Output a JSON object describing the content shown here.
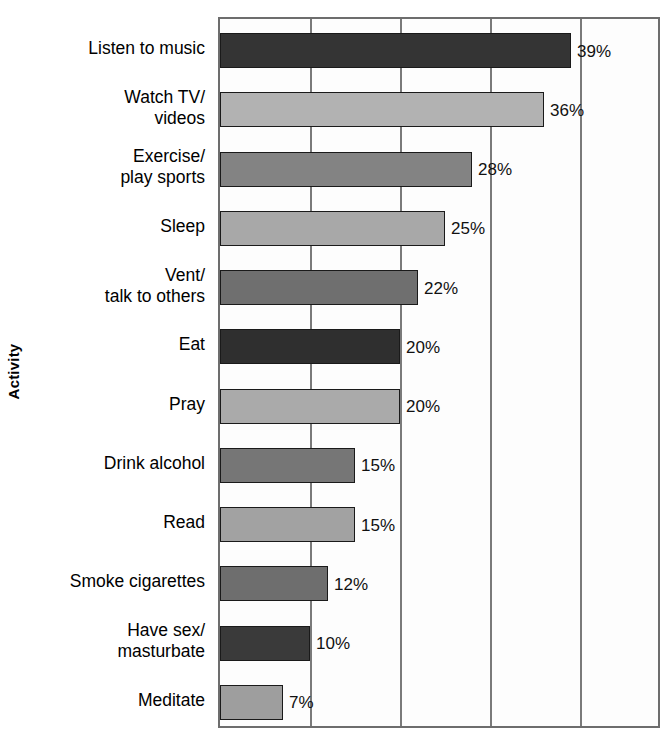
{
  "chart_data": {
    "type": "bar",
    "orientation": "horizontal",
    "title": "",
    "xlabel": "",
    "ylabel": "Activity",
    "xlim": [
      0,
      49
    ],
    "grid": true,
    "gridlines": [
      10,
      20,
      30,
      40
    ],
    "legend": "none",
    "value_suffix": "%",
    "categories": [
      "Listen to music",
      "Watch TV/ videos",
      "Exercise/ play sports",
      "Sleep",
      "Vent/ talk to others",
      "Eat",
      "Pray",
      "Drink alcohol",
      "Read",
      "Smoke cigarettes",
      "Have sex/ masturbate",
      "Meditate"
    ],
    "values": [
      39,
      36,
      28,
      25,
      22,
      20,
      20,
      15,
      15,
      12,
      10,
      7
    ],
    "value_labels": [
      "39%",
      "36%",
      "28%",
      "25%",
      "22%",
      "20%",
      "20%",
      "15%",
      "15%",
      "12%",
      "10%",
      "7%"
    ],
    "bar_colors": [
      "#343434",
      "#b2b2b2",
      "#838383",
      "#a8a8a8",
      "#6f6f6f",
      "#2f2f2f",
      "#aaaaaa",
      "#767676",
      "#a2a2a2",
      "#6e6e6e",
      "#3a3a3a",
      "#9e9e9e"
    ]
  },
  "axis": {
    "y_title": "Activity"
  },
  "bars": [
    {
      "label_line1": "Listen to music",
      "label_line2": "",
      "value": 39,
      "value_label": "39%",
      "color": "#343434"
    },
    {
      "label_line1": "Watch TV/",
      "label_line2": "videos",
      "value": 36,
      "value_label": "36%",
      "color": "#b2b2b2"
    },
    {
      "label_line1": "Exercise/",
      "label_line2": "play sports",
      "value": 28,
      "value_label": "28%",
      "color": "#838383"
    },
    {
      "label_line1": "Sleep",
      "label_line2": "",
      "value": 25,
      "value_label": "25%",
      "color": "#a8a8a8"
    },
    {
      "label_line1": "Vent/",
      "label_line2": "talk to others",
      "value": 22,
      "value_label": "22%",
      "color": "#6f6f6f"
    },
    {
      "label_line1": "Eat",
      "label_line2": "",
      "value": 20,
      "value_label": "20%",
      "color": "#2f2f2f"
    },
    {
      "label_line1": "Pray",
      "label_line2": "",
      "value": 20,
      "value_label": "20%",
      "color": "#aaaaaa"
    },
    {
      "label_line1": "Drink alcohol",
      "label_line2": "",
      "value": 15,
      "value_label": "15%",
      "color": "#767676"
    },
    {
      "label_line1": "Read",
      "label_line2": "",
      "value": 15,
      "value_label": "15%",
      "color": "#a2a2a2"
    },
    {
      "label_line1": "Smoke cigarettes",
      "label_line2": "",
      "value": 12,
      "value_label": "12%",
      "color": "#6e6e6e"
    },
    {
      "label_line1": "Have sex/",
      "label_line2": "masturbate",
      "value": 10,
      "value_label": "10%",
      "color": "#3a3a3a"
    },
    {
      "label_line1": "Meditate",
      "label_line2": "",
      "value": 7,
      "value_label": "7%",
      "color": "#9e9e9e"
    }
  ]
}
